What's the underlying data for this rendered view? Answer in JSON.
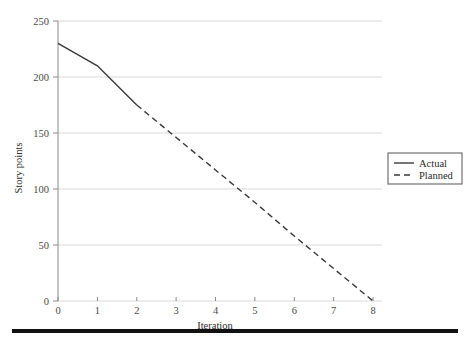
{
  "figure": {
    "top_caption": ". .        . .            . .        . .",
    "bottom_rule_color": "#111111",
    "background": "#ffffff"
  },
  "axes": {
    "x_title": "Iteration",
    "y_title": "Story points",
    "x_ticks": [
      "0",
      "1",
      "2",
      "3",
      "4",
      "5",
      "6",
      "7",
      "8"
    ],
    "y_ticks": [
      "0",
      "50",
      "100",
      "150",
      "200",
      "250"
    ],
    "grid_color": "#d9d9d9",
    "axis_color": "#8a8a8a"
  },
  "legend": {
    "position": "right-middle",
    "border_color": "#555555",
    "entries": [
      {
        "label": "Actual",
        "style": "solid",
        "color": "#3a3a3a"
      },
      {
        "label": "Planned",
        "style": "dashed",
        "color": "#3a3a3a"
      }
    ]
  },
  "chart_data": {
    "type": "line",
    "title": "",
    "subtitle": "",
    "xlabel": "Iteration",
    "ylabel": "Story points",
    "xlim": [
      0,
      8
    ],
    "ylim": [
      0,
      250
    ],
    "x_tick_step": 1,
    "y_tick_step": 50,
    "grid": "horizontal",
    "legend_position": "right-middle",
    "series": [
      {
        "name": "Actual",
        "style": "solid",
        "color": "#3a3a3a",
        "x": [
          0,
          1,
          2
        ],
        "values": [
          230,
          210,
          175
        ]
      },
      {
        "name": "Planned",
        "style": "dashed",
        "color": "#3a3a3a",
        "x": [
          2,
          3,
          4,
          5,
          6,
          7,
          8
        ],
        "values": [
          175,
          146,
          117,
          88,
          58,
          29,
          0
        ]
      }
    ]
  }
}
